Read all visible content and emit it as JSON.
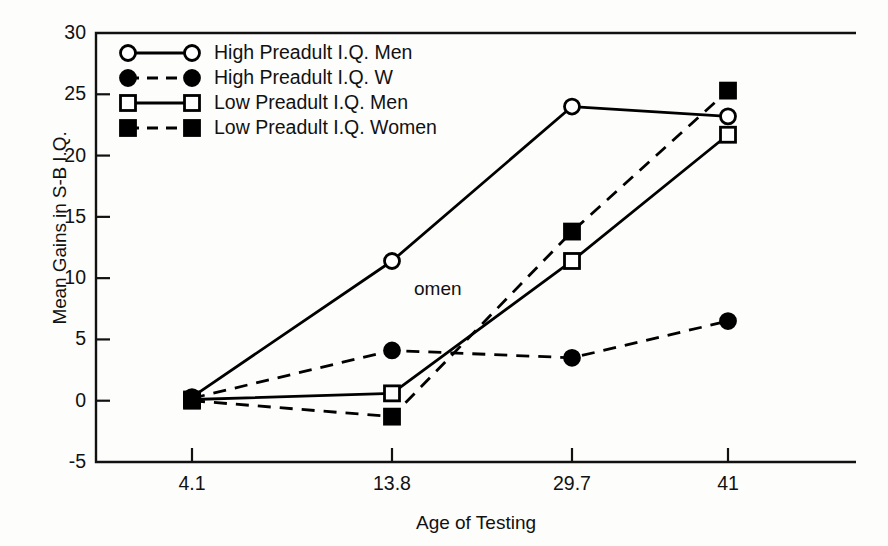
{
  "chart_data": {
    "type": "line",
    "title": "",
    "xlabel": "Age of Testing",
    "ylabel": "Mean Gains in S-B I.Q.",
    "categories": [
      "4.1",
      "13.8",
      "29.7",
      "41"
    ],
    "x": [
      4.1,
      13.8,
      29.7,
      41
    ],
    "xtick_labels": [
      "4.1",
      "13.8",
      "29.7",
      "41"
    ],
    "ytick_labels": [
      "30",
      "25",
      "20",
      "15",
      "10",
      "5",
      "0",
      "-5"
    ],
    "ytick_values": [
      30,
      25,
      20,
      15,
      10,
      5,
      0,
      -5
    ],
    "ylim": [
      -5,
      30
    ],
    "grid": false,
    "legend_position": "upper left",
    "annotations": [
      {
        "text": "omen",
        "x": 13.8,
        "y": 9.0
      }
    ],
    "series": [
      {
        "name": "High Preadult I.Q. Men",
        "marker": "circle-open",
        "line": "solid",
        "values": [
          0.3,
          11.4,
          24.0,
          23.2
        ]
      },
      {
        "name": "High Preadult I.Q. W",
        "marker": "circle-filled",
        "line": "dashed",
        "values": [
          0.2,
          4.1,
          3.5,
          6.5
        ]
      },
      {
        "name": "Low Preadult I.Q. Men",
        "marker": "square-open",
        "line": "solid",
        "values": [
          0.1,
          0.6,
          11.4,
          21.7
        ]
      },
      {
        "name": "Low Preadult I.Q. Women",
        "marker": "square-filled",
        "line": "dashed",
        "values": [
          0.0,
          -1.3,
          13.8,
          25.3
        ]
      }
    ]
  },
  "legend": {
    "items": [
      {
        "label": "High Preadult I.Q. Men",
        "marker": "circle-open",
        "line": "solid"
      },
      {
        "label": "High Preadult I.Q. W",
        "marker": "circle-filled",
        "line": "dashed"
      },
      {
        "label": "Low Preadult I.Q. Men",
        "marker": "square-open",
        "line": "solid"
      },
      {
        "label": "Low Preadult I.Q. Women",
        "marker": "square-filled",
        "line": "dashed"
      }
    ]
  },
  "axes": {
    "x_title": "Age of Testing",
    "y_title": "Mean Gains in S-B I.Q."
  },
  "colors": {
    "ink": "#000000",
    "background": "#fdfdfc",
    "marker_fill": "#ffffff"
  }
}
